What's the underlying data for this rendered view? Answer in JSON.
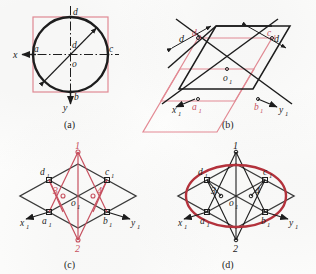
{
  "figure": {
    "kind": "isometric-ellipse-four-center-construction",
    "panel_captions": [
      "(a)",
      "(b)",
      "(c)",
      "(d)"
    ],
    "colors": {
      "construction_black": "#1a1a1a",
      "construction_red": "#c94f5e",
      "ellipse_red": "#b5303a",
      "square_pink": "#e58a94",
      "paper": "#fdfdfc"
    }
  },
  "panel_a": {
    "caption": "(a)",
    "axis_x_label": "x",
    "axis_y_label": "y",
    "center_label": "o",
    "point_left": "a",
    "point_right": "c",
    "point_top": "d",
    "point_bottom": "b",
    "diameter_label": "d",
    "shapes": {
      "square": "circumscribed-square",
      "circle": "true-circle",
      "centerlines": "dash-dot"
    }
  },
  "panel_b": {
    "caption": "(b)",
    "axis_x_label": "x",
    "axis_x_sub": "1",
    "axis_y_label": "y",
    "axis_y_sub": "1",
    "center_label": "o",
    "center_sub": "1",
    "point_left": "a",
    "point_left_sub": "1",
    "point_right": "b",
    "point_right_sub": "1",
    "point_upper_left": "d",
    "point_upper_left_sub": "1",
    "point_upper_right": "c",
    "point_upper_right_sub": "1",
    "dimension_left": "d",
    "dimension_right": "d",
    "shapes": {
      "rhombus": "isometric-square-rhombus",
      "inner_rhombus": "pink-midpoint-rhombus",
      "dimension_arrows": 4
    }
  },
  "panel_c": {
    "caption": "(c)",
    "axis_x_label": "x",
    "axis_x_sub": "1",
    "axis_y_label": "y",
    "axis_y_sub": "1",
    "center_label": "o",
    "center_sub": "1",
    "point_left": "a",
    "point_left_sub": "1",
    "point_right": "b",
    "point_right_sub": "1",
    "point_upper_left": "d",
    "point_upper_left_sub": "1",
    "point_upper_right": "c",
    "point_upper_right_sub": "1",
    "center_1": "1",
    "center_2": "2",
    "center_3": "3",
    "center_4": "4",
    "shapes": {
      "rhombus": "isometric-square-rhombus",
      "construction_rays": "red-four-center-rays"
    }
  },
  "panel_d": {
    "caption": "(d)",
    "axis_x_label": "x",
    "axis_x_sub": "1",
    "axis_y_label": "y",
    "axis_y_sub": "1",
    "center_label": "o",
    "center_sub": "1",
    "point_left": "a",
    "point_left_sub": "1",
    "point_right": "b",
    "point_right_sub": "1",
    "point_upper_left": "d",
    "point_upper_left_sub": "1",
    "point_upper_right": "c",
    "point_upper_right_sub": "1",
    "center_1": "1",
    "center_2": "2",
    "center_3": "3",
    "center_4": "4",
    "shapes": {
      "rhombus": "isometric-square-rhombus",
      "construction_rays": "black-four-center-rays",
      "ellipse": "completed-isometric-ellipse"
    }
  }
}
